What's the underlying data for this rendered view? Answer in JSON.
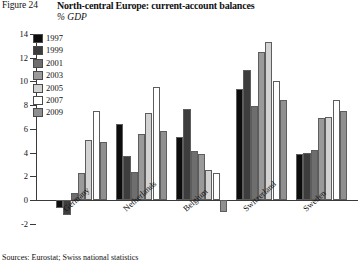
{
  "figure": {
    "number": "Figure 24",
    "title": "North-central Europe: current-account balances",
    "units": "% GDP",
    "source": "Sources: Eurostat; Swiss national statistics"
  },
  "chart_data": {
    "type": "bar",
    "title": "North-central Europe: current-account balances",
    "subtitle": "% GDP",
    "xlabel": "",
    "ylabel": "% GDP",
    "ylim": [
      -2,
      14
    ],
    "yticks": [
      -2,
      0,
      2,
      4,
      6,
      8,
      10,
      12,
      14
    ],
    "ytick_labels": [
      "-2",
      "0",
      "2",
      "4",
      "6",
      "8",
      "10",
      "12",
      "14"
    ],
    "grid": false,
    "legend_position": "top-left",
    "categories": [
      "Germany",
      "Netherlands",
      "Belgium",
      "Switzerland",
      "Sweden"
    ],
    "series": [
      {
        "name": "1997",
        "color": "#0d0d0d",
        "values": [
          -0.7,
          6.4,
          5.3,
          9.4,
          3.9
        ]
      },
      {
        "name": "1999",
        "color": "#3d3d3d",
        "values": [
          -1.3,
          3.7,
          7.7,
          11.0,
          4.0
        ]
      },
      {
        "name": "2001",
        "color": "#6e6e6e",
        "values": [
          0.6,
          2.4,
          4.1,
          7.9,
          4.2
        ]
      },
      {
        "name": "2003",
        "color": "#9a9a9a",
        "values": [
          2.3,
          5.6,
          3.9,
          12.5,
          6.9
        ]
      },
      {
        "name": "2005",
        "color": "#d2d2d2",
        "values": [
          5.1,
          7.3,
          2.5,
          13.3,
          7.0
        ]
      },
      {
        "name": "2007",
        "color": "#ffffff",
        "values": [
          7.5,
          9.5,
          2.3,
          10.0,
          8.4
        ]
      },
      {
        "name": "2009",
        "color": "#8f8f8f",
        "values": [
          4.9,
          5.8,
          -1.0,
          8.4,
          7.5
        ]
      }
    ]
  },
  "legend": {
    "items": [
      {
        "label": "1997",
        "color": "#0d0d0d"
      },
      {
        "label": "1999",
        "color": "#3d3d3d"
      },
      {
        "label": "2001",
        "color": "#6e6e6e"
      },
      {
        "label": "2003",
        "color": "#9a9a9a"
      },
      {
        "label": "2005",
        "color": "#d2d2d2"
      },
      {
        "label": "2007",
        "color": "#ffffff"
      },
      {
        "label": "2009",
        "color": "#8f8f8f"
      }
    ]
  }
}
